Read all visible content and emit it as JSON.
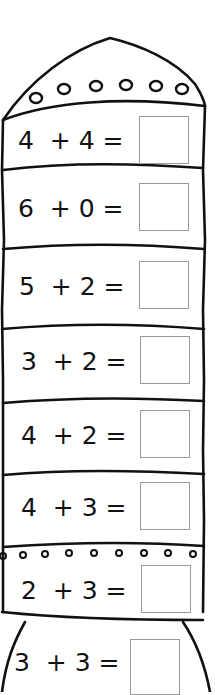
{
  "worksheet": {
    "title": "Rocket addition",
    "colors": {
      "outline": "#111111",
      "answer_box_border": "#9a9a9a",
      "background": "#ffffff"
    },
    "problems": [
      {
        "a": "4",
        "op": "+",
        "b": "4",
        "eq": "=",
        "text": "4  + 4 =",
        "answer": ""
      },
      {
        "a": "6",
        "op": "+",
        "b": "0",
        "eq": "=",
        "text": "6  + 0 =",
        "answer": ""
      },
      {
        "a": "5",
        "op": "+",
        "b": "2",
        "eq": "=",
        "text": "5  + 2 =",
        "answer": ""
      },
      {
        "a": "3",
        "op": "+",
        "b": "2",
        "eq": "=",
        "text": "3  + 2 =",
        "answer": ""
      },
      {
        "a": "4",
        "op": "+",
        "b": "2",
        "eq": "=",
        "text": "4  + 2 =",
        "answer": ""
      },
      {
        "a": "4",
        "op": "+",
        "b": "3",
        "eq": "=",
        "text": "4  + 3 =",
        "answer": ""
      },
      {
        "a": "2",
        "op": "+",
        "b": "3",
        "eq": "=",
        "text": "2  + 3 =",
        "answer": ""
      },
      {
        "a": "3",
        "op": "+",
        "b": "3",
        "eq": "=",
        "text": "3  + 3 =",
        "answer": ""
      }
    ]
  }
}
